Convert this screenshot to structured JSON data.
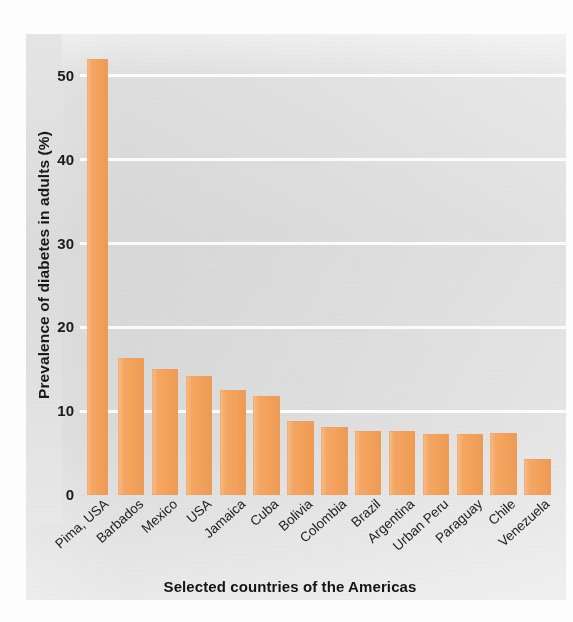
{
  "chart_data": {
    "type": "bar",
    "title": "",
    "xlabel": "Selected countries of the Americas",
    "ylabel": "Prevalence of diabetes in adults (%)",
    "categories": [
      "Pima, USA",
      "Barbados",
      "Mexico",
      "USA",
      "Jamaica",
      "Cuba",
      "Bolivia",
      "Colombia",
      "Brazil",
      "Argentina",
      "Urban Peru",
      "Paraguay",
      "Chile",
      "Venezuela"
    ],
    "values": [
      52.0,
      16.4,
      15.0,
      14.2,
      12.5,
      11.8,
      8.8,
      8.1,
      7.6,
      7.6,
      7.3,
      7.3,
      7.4,
      4.3
    ],
    "ylim": [
      0,
      55
    ],
    "yticks": [
      0,
      10,
      20,
      30,
      40,
      50
    ],
    "ytick_labels": [
      "0",
      "10",
      "20",
      "30",
      "40",
      "50"
    ],
    "grid": true,
    "legend": false,
    "bar_color": "#f5a35c",
    "gridline_color": "#ffffff",
    "background_color": "#e3e3e3"
  },
  "axis": {
    "y_title": "Prevalence of diabetes in adults (%)",
    "x_title": "Selected countries of the Americas"
  }
}
